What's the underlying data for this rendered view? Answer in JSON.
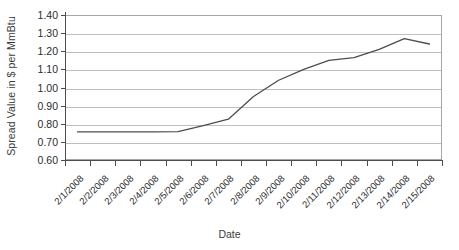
{
  "chart_data": {
    "type": "line",
    "title": "",
    "xlabel": "Date",
    "ylabel": "Spread Value in $ per MmBtu",
    "categories": [
      "2/1/2008",
      "2/2/2008",
      "2/3/2008",
      "2/4/2008",
      "2/5/2008",
      "2/6/2008",
      "2/7/2008",
      "2/8/2008",
      "2/9/2008",
      "2/10/2008",
      "2/11/2008",
      "2/12/2008",
      "2/13/2008",
      "2/14/2008",
      "2/15/2008"
    ],
    "values": [
      0.755,
      0.755,
      0.755,
      0.755,
      0.757,
      0.79,
      0.825,
      0.95,
      1.04,
      1.1,
      1.15,
      1.165,
      1.21,
      1.27,
      1.24
    ],
    "ylim": [
      0.6,
      1.4
    ],
    "ytick_step": 0.1,
    "yticks": [
      "1.40",
      "1.30",
      "1.20",
      "1.10",
      "1.00",
      "0.90",
      "0.80",
      "0.70",
      "0.60"
    ],
    "grid": true,
    "legend": "none",
    "series_color": "#4d4d4d",
    "gridline_color": "#bfbfbf",
    "axis_color": "#4d4d4d",
    "background": "#ffffff"
  }
}
